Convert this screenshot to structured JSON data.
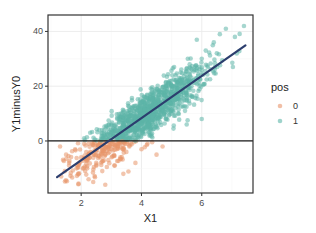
{
  "chart_data": {
    "type": "scatter",
    "title": "",
    "xlabel": "X1",
    "ylabel": "Y1minusY0",
    "xlim": [
      0.9,
      7.7
    ],
    "ylim": [
      -19,
      46
    ],
    "x_ticks": [
      2,
      4,
      6
    ],
    "y_ticks": [
      0,
      20,
      40
    ],
    "grid": true,
    "legend": {
      "title": "pos",
      "position": "right",
      "entries": [
        {
          "label": "0",
          "color": "#E8956A"
        },
        {
          "label": "1",
          "color": "#5DB5A8"
        }
      ]
    },
    "hline": {
      "y": 0,
      "color": "#1a1a1a"
    },
    "fit_line": {
      "color": "#2C3E6E",
      "x": [
        1.2,
        7.45
      ],
      "y": [
        -13.2,
        34.9
      ],
      "slope": 7.7,
      "intercept": -22.4
    },
    "series": [
      {
        "name": "0",
        "color": "#E8956A",
        "description": "points with Y1minusY0 < 0",
        "x_range": [
          1.2,
          4.8
        ],
        "y_range": [
          -17,
          0
        ],
        "sample_points": [
          [
            1.3,
            -2
          ],
          [
            1.5,
            -5
          ],
          [
            1.6,
            -9
          ],
          [
            1.8,
            -3
          ],
          [
            1.9,
            -12
          ],
          [
            2.0,
            -6
          ],
          [
            2.1,
            -1
          ],
          [
            2.2,
            -10
          ],
          [
            2.3,
            -4
          ],
          [
            2.4,
            -15
          ],
          [
            2.5,
            -8
          ],
          [
            2.6,
            -2
          ],
          [
            2.7,
            -11
          ],
          [
            2.8,
            -5
          ],
          [
            2.8,
            -16
          ],
          [
            2.9,
            -7
          ],
          [
            3.0,
            -3
          ],
          [
            3.1,
            -9
          ],
          [
            3.2,
            -1
          ],
          [
            3.3,
            -6
          ],
          [
            3.4,
            -12
          ],
          [
            3.5,
            -4
          ],
          [
            3.6,
            -2
          ],
          [
            3.8,
            -8
          ],
          [
            4.0,
            -3
          ],
          [
            4.2,
            -1
          ],
          [
            4.5,
            -5
          ],
          [
            4.7,
            -2
          ]
        ]
      },
      {
        "name": "1",
        "color": "#5DB5A8",
        "description": "points with Y1minusY0 >= 0",
        "x_range": [
          2.0,
          7.5
        ],
        "y_range": [
          0,
          43
        ],
        "sample_points": [
          [
            2.1,
            1
          ],
          [
            2.3,
            3
          ],
          [
            2.6,
            4
          ],
          [
            2.9,
            2
          ],
          [
            3.0,
            6
          ],
          [
            3.2,
            8
          ],
          [
            3.4,
            5
          ],
          [
            3.5,
            10
          ],
          [
            3.7,
            12
          ],
          [
            3.8,
            7
          ],
          [
            4.0,
            14
          ],
          [
            4.1,
            10
          ],
          [
            4.3,
            16
          ],
          [
            4.4,
            12
          ],
          [
            4.6,
            18
          ],
          [
            4.8,
            20
          ],
          [
            4.9,
            15
          ],
          [
            5.0,
            22
          ],
          [
            5.2,
            19
          ],
          [
            5.3,
            25
          ],
          [
            5.5,
            23
          ],
          [
            5.6,
            28
          ],
          [
            5.8,
            26
          ],
          [
            6.0,
            30
          ],
          [
            6.2,
            27
          ],
          [
            6.4,
            36
          ],
          [
            6.5,
            32
          ],
          [
            6.6,
            39
          ],
          [
            6.8,
            41
          ],
          [
            7.1,
            38
          ],
          [
            7.4,
            42
          ],
          [
            5.5,
            6
          ],
          [
            6.0,
            8
          ]
        ]
      }
    ],
    "point_counts_approx": {
      "0": 300,
      "1": 900
    }
  }
}
